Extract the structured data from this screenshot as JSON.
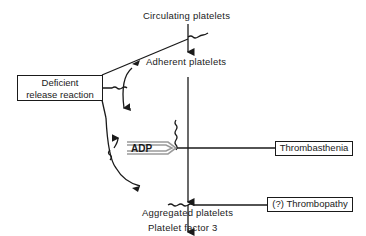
{
  "diagram": {
    "nodes": {
      "circulating": "Circulating platelets",
      "adherent": "Adherent platelets",
      "aggregated": "Aggregated platelets",
      "pf3": "Platelet factor 3"
    },
    "defects": {
      "release_line1": "Deficient",
      "release_line2": "release reaction",
      "thrombasthenia": "Thrombasthenia",
      "thrombopathy": "(?) Thrombopathy"
    },
    "mediator": "ADP",
    "colors": {
      "ink": "#1a1a1a",
      "background": "#ffffff",
      "adp_arrow": "#9a9a9a"
    }
  }
}
